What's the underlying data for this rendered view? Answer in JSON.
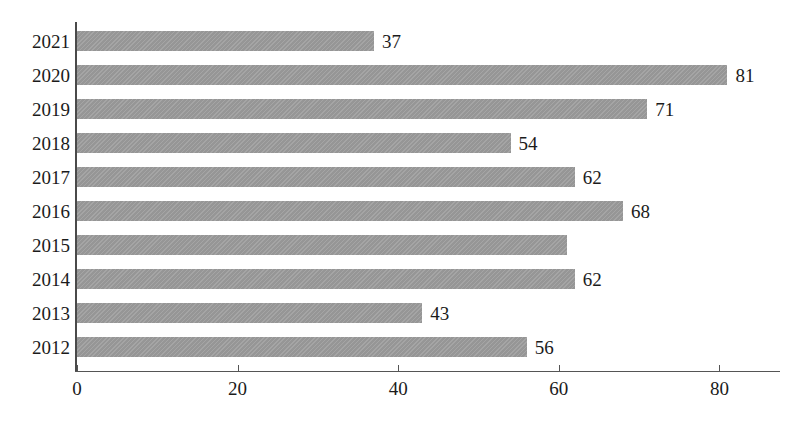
{
  "chart_data": {
    "type": "bar",
    "orientation": "horizontal",
    "title": "",
    "subtitle": "",
    "xlabel": "",
    "ylabel": "",
    "categories": [
      "2021",
      "2020",
      "2019",
      "2018",
      "2017",
      "2016",
      "2015",
      "2014",
      "2013",
      "2012"
    ],
    "values": [
      37,
      81,
      71,
      54,
      62,
      68,
      61,
      62,
      43,
      56
    ],
    "data_labels": [
      "37",
      "81",
      "71",
      "54",
      "62",
      "68",
      "",
      "62",
      "43",
      "56"
    ],
    "xlim": [
      0,
      88
    ],
    "xticks": [
      0,
      20,
      40,
      60,
      80
    ],
    "xtick_labels": [
      "0",
      "20",
      "40",
      "60",
      "80"
    ],
    "grid": false,
    "legend": false,
    "legend_position": "none",
    "series": [
      {
        "name": "",
        "values": [
          37,
          81,
          71,
          54,
          62,
          68,
          61,
          62,
          43,
          56
        ],
        "color": "#9b9b9b"
      }
    ]
  },
  "colors": {
    "bar_fill": "#9b9b9b",
    "axis": "#555555",
    "text": "#1b1b1b",
    "background": "#ffffff"
  }
}
